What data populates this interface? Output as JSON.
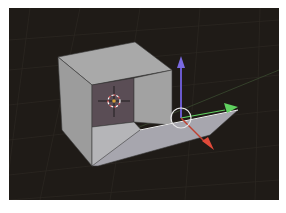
{
  "viewport": {
    "name": "3D Viewport",
    "background_color": "#1f1b17",
    "grid_color": "#2e2a24"
  },
  "scene": {
    "object": "Cube",
    "mode": "Edit Mode - face hinged open",
    "face_colors": {
      "top": "#a9a9a9",
      "left": "#9c9c9c",
      "right_inner": "#a2a2a2",
      "back_inner": "#5a4d55",
      "floor_inner": "#b5b5b8",
      "flap": "#a7a6ae"
    }
  },
  "cursor_3d": {
    "label": "3D cursor",
    "ring_colors": [
      "#ffffff",
      "#d24a4a"
    ],
    "center_color": "#d9a23a"
  },
  "manipulator": {
    "label": "Transform manipulator",
    "axes": [
      {
        "axis": "Z",
        "color": "#6a5acd"
      },
      {
        "axis": "Y",
        "color": "#5fd15f"
      },
      {
        "axis": "X",
        "color": "#e04a3a"
      }
    ],
    "circle_color": "#e6e6e6"
  }
}
